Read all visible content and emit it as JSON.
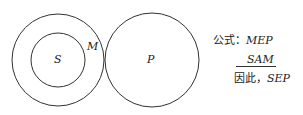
{
  "diagram": {
    "circles": [
      {
        "id": "M",
        "label": "M",
        "cx": 58,
        "cy": 60,
        "r": 46
      },
      {
        "id": "S",
        "label": "S",
        "cx": 58,
        "cy": 60,
        "r": 27
      },
      {
        "id": "P",
        "label": "P",
        "cx": 152,
        "cy": 60,
        "r": 47
      }
    ],
    "stroke_color": "#333333"
  },
  "formula": {
    "major_prefix": "公式：",
    "major_premise": "MEP",
    "minor_premise": "SAM",
    "conclusion_prefix": "因此，",
    "conclusion": "SEP"
  }
}
